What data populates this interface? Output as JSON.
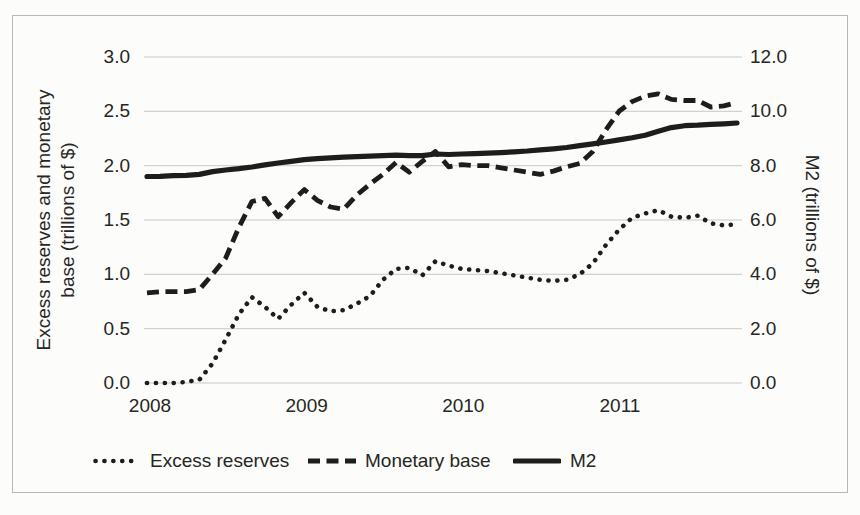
{
  "chart_data": {
    "type": "line",
    "title": "",
    "x_tick_labels": [
      "2008",
      "2009",
      "2010",
      "2011"
    ],
    "x_sampling": "monthly",
    "grid": true,
    "legend_position": "bottom",
    "left_axis": {
      "label": "Excess reserves and monetary base (trillions of $)",
      "label_lines": [
        "Excess reserves and monetary",
        "base (trillions of $)"
      ],
      "ticks": [
        "3.0",
        "2.5",
        "2.0",
        "1.5",
        "1.0",
        "0.5",
        "0.0"
      ],
      "min": 0,
      "max": 3
    },
    "right_axis": {
      "label": "M2 (trillions of $)",
      "ticks": [
        "12.0",
        "10.0",
        "8.0",
        "6.0",
        "4.0",
        "2.0",
        "0.0"
      ],
      "min": 0,
      "max": 12
    },
    "series": [
      {
        "name": "Excess reserves",
        "style": "dotted",
        "axis": "left",
        "values": [
          0.0,
          0.0,
          0.0,
          0.01,
          0.03,
          0.18,
          0.4,
          0.63,
          0.79,
          0.7,
          0.59,
          0.72,
          0.83,
          0.7,
          0.66,
          0.67,
          0.73,
          0.8,
          0.95,
          1.05,
          1.06,
          0.99,
          1.12,
          1.08,
          1.05,
          1.04,
          1.03,
          1.01,
          0.99,
          0.97,
          0.95,
          0.94,
          0.95,
          1.0,
          1.1,
          1.27,
          1.41,
          1.52,
          1.56,
          1.59,
          1.53,
          1.52,
          1.54,
          1.47,
          1.45,
          1.46
        ]
      },
      {
        "name": "Monetary base",
        "style": "dashed",
        "axis": "left",
        "values": [
          0.83,
          0.84,
          0.84,
          0.84,
          0.86,
          1.0,
          1.15,
          1.43,
          1.67,
          1.7,
          1.53,
          1.66,
          1.78,
          1.68,
          1.62,
          1.6,
          1.73,
          1.83,
          1.92,
          2.03,
          1.94,
          2.04,
          2.13,
          1.99,
          2.01,
          2.0,
          2.0,
          1.98,
          1.96,
          1.94,
          1.92,
          1.95,
          1.99,
          2.02,
          2.13,
          2.33,
          2.5,
          2.59,
          2.64,
          2.66,
          2.61,
          2.6,
          2.6,
          2.54,
          2.55,
          2.58
        ]
      },
      {
        "name": "M2",
        "style": "solid",
        "axis": "right",
        "values": [
          7.6,
          7.61,
          7.63,
          7.64,
          7.68,
          7.78,
          7.84,
          7.89,
          7.95,
          8.03,
          8.1,
          8.16,
          8.22,
          8.26,
          8.29,
          8.31,
          8.33,
          8.35,
          8.37,
          8.39,
          8.37,
          8.37,
          8.43,
          8.41,
          8.43,
          8.44,
          8.46,
          8.48,
          8.51,
          8.54,
          8.58,
          8.62,
          8.67,
          8.74,
          8.8,
          8.87,
          8.95,
          9.03,
          9.12,
          9.27,
          9.4,
          9.47,
          9.49,
          9.52,
          9.54,
          9.57
        ]
      }
    ],
    "colors": {
      "series": "#1d1d1b",
      "gridline": "#c8c8c4",
      "text": "#262624"
    }
  }
}
